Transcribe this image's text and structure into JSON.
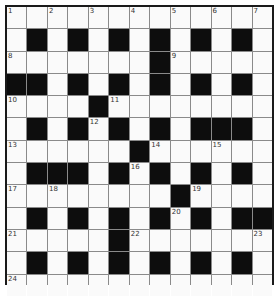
{
  "crossword": {
    "rows": 13,
    "cols": 13,
    "colors": {
      "black": "#0d0d0d",
      "white": "#fafafa",
      "grid_line": "#8a8a8a",
      "border": "#1a1a1a",
      "number": "#333333"
    },
    "layout": [
      ".............",
      ".#.#.#.#.#.#.",
      ".......#.....",
      "##.#.#.#.#.#.",
      "....#........",
      ".#.#.#.#.###.",
      "......#......",
      ".###.#.#.#.#.",
      "........#....",
      ".#.#.#.#.#.##",
      ".....#.......",
      ".#.#.#.#.#.#.",
      "............."
    ],
    "numbers": [
      {
        "row": 0,
        "col": 0,
        "n": "1"
      },
      {
        "row": 0,
        "col": 2,
        "n": "2"
      },
      {
        "row": 0,
        "col": 4,
        "n": "3"
      },
      {
        "row": 0,
        "col": 6,
        "n": "4"
      },
      {
        "row": 0,
        "col": 8,
        "n": "5"
      },
      {
        "row": 0,
        "col": 10,
        "n": "6"
      },
      {
        "row": 0,
        "col": 12,
        "n": "7"
      },
      {
        "row": 2,
        "col": 0,
        "n": "8"
      },
      {
        "row": 2,
        "col": 8,
        "n": "9"
      },
      {
        "row": 4,
        "col": 0,
        "n": "10"
      },
      {
        "row": 4,
        "col": 5,
        "n": "11"
      },
      {
        "row": 5,
        "col": 4,
        "n": "12"
      },
      {
        "row": 6,
        "col": 0,
        "n": "13"
      },
      {
        "row": 6,
        "col": 7,
        "n": "14"
      },
      {
        "row": 6,
        "col": 10,
        "n": "15"
      },
      {
        "row": 7,
        "col": 6,
        "n": "16"
      },
      {
        "row": 8,
        "col": 0,
        "n": "17"
      },
      {
        "row": 8,
        "col": 2,
        "n": "18"
      },
      {
        "row": 8,
        "col": 9,
        "n": "19"
      },
      {
        "row": 9,
        "col": 8,
        "n": "20"
      },
      {
        "row": 10,
        "col": 0,
        "n": "21"
      },
      {
        "row": 10,
        "col": 6,
        "n": "22"
      },
      {
        "row": 10,
        "col": 12,
        "n": "23"
      },
      {
        "row": 12,
        "col": 0,
        "n": "24"
      }
    ]
  }
}
